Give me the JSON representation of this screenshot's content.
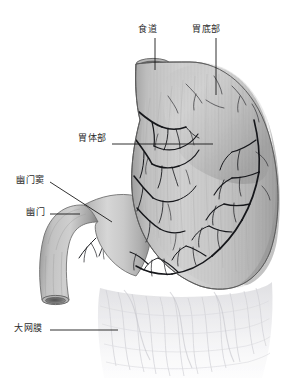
{
  "figure": {
    "background_color": "#ffffff",
    "style": "grayscale medical illustration"
  },
  "labels": [
    {
      "id": "esophagus",
      "text": "食道",
      "pinyin": "shi dao",
      "english": "Esophagus",
      "label_x": 138,
      "label_y": 25,
      "leader": {
        "x1": 155,
        "y1": 38,
        "x2": 155,
        "y2": 70
      }
    },
    {
      "id": "fundus",
      "text": "胃底部",
      "pinyin": "wei di bu",
      "english": "Gastric fundus",
      "label_x": 192,
      "label_y": 25,
      "leader": {
        "x1": 216,
        "y1": 38,
        "x2": 216,
        "y2": 95
      }
    },
    {
      "id": "body",
      "text": "胃体部",
      "pinyin": "wei ti bu",
      "english": "Gastric body",
      "label_x": 78,
      "label_y": 134,
      "leader": {
        "x1": 112,
        "y1": 144,
        "x2": 213,
        "y2": 144
      }
    },
    {
      "id": "antrum",
      "text": "幽门窦",
      "pinyin": "you men dou",
      "english": "Pyloric antrum",
      "label_x": 16,
      "label_y": 176,
      "leader": {
        "x1": 50,
        "y1": 182,
        "x2": 112,
        "y2": 222
      }
    },
    {
      "id": "pylorus",
      "text": "幽门",
      "pinyin": "you men",
      "english": "Pylorus",
      "label_x": 26,
      "label_y": 208,
      "leader": {
        "x1": 50,
        "y1": 214,
        "x2": 80,
        "y2": 214
      }
    },
    {
      "id": "omentum",
      "text": "大网膜",
      "pinyin": "da wang mo",
      "english": "Greater omentum",
      "label_x": 14,
      "label_y": 324,
      "leader": {
        "x1": 50,
        "y1": 330,
        "x2": 118,
        "y2": 330
      }
    }
  ],
  "colors": {
    "label_text": "#2a2a2a",
    "leader_line": "#1a1a1a",
    "organ_light": "#d4d4d4",
    "organ_mid": "#b4b4b4",
    "organ_dark": "#8e8e8e",
    "organ_shadow": "#707070",
    "vessel": "#15161a",
    "omentum": "#e8e8ea",
    "outline": "#5a5a5a",
    "background": "#ffffff"
  },
  "parts": [
    {
      "name": "esophagus",
      "label": "食道"
    },
    {
      "name": "gastric-fundus",
      "label": "胃底部"
    },
    {
      "name": "gastric-body",
      "label": "胃体部"
    },
    {
      "name": "pyloric-antrum",
      "label": "幽门窦"
    },
    {
      "name": "pylorus",
      "label": "幽门"
    },
    {
      "name": "duodenum",
      "label": ""
    },
    {
      "name": "greater-omentum",
      "label": "大网膜"
    },
    {
      "name": "gastric-vessels",
      "label": ""
    }
  ]
}
